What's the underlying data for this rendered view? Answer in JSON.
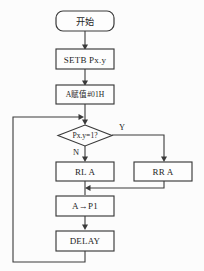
{
  "diagram": {
    "type": "flowchart",
    "background_color": "#fcfcfc",
    "line_color": "#3a3a3a",
    "node_fill": "#fdfdfd",
    "text_color": "#1d1d1d"
  },
  "nodes": {
    "start": {
      "label": "开始",
      "shape": "rounded-rectangle"
    },
    "setb": {
      "label": "SETB Px.y",
      "shape": "rectangle"
    },
    "assign": {
      "label": "A赋值#01H",
      "shape": "rectangle"
    },
    "decision": {
      "label": "Px.y=1?",
      "shape": "diamond"
    },
    "rotate_left": {
      "label": "RL  A",
      "shape": "rectangle"
    },
    "rotate_right": {
      "label": "RR A",
      "shape": "rectangle"
    },
    "output": {
      "label": "A→P1",
      "shape": "rectangle"
    },
    "delay": {
      "label": "DELAY",
      "shape": "rectangle"
    }
  },
  "branches": {
    "yes_label": "Y",
    "no_label": "N"
  },
  "edges": [
    {
      "name": "start-to-setb",
      "from": "start",
      "to": "setb"
    },
    {
      "name": "setb-to-assign",
      "from": "setb",
      "to": "assign"
    },
    {
      "name": "assign-to-decision",
      "from": "assign",
      "to": "decision"
    },
    {
      "name": "decision-no-to-rotate-left",
      "from": "decision",
      "to": "rotate_left",
      "label": "N"
    },
    {
      "name": "decision-yes-to-rotate-right",
      "from": "decision",
      "to": "rotate_right",
      "label": "Y"
    },
    {
      "name": "rotate-left-to-output",
      "from": "rotate_left",
      "to": "output"
    },
    {
      "name": "rotate-right-to-output",
      "from": "rotate_right",
      "to": "output"
    },
    {
      "name": "output-to-delay",
      "from": "output",
      "to": "delay"
    },
    {
      "name": "delay-loop-back-to-decision",
      "from": "delay",
      "to": "decision"
    }
  ]
}
